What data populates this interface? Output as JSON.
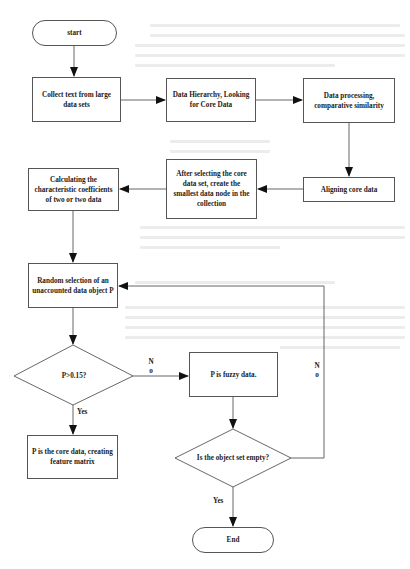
{
  "diagram": {
    "type": "flowchart",
    "nodes": {
      "start": {
        "label": "start",
        "shape": "terminator"
      },
      "collect": {
        "label": "Collect text from large data sets",
        "shape": "process"
      },
      "hierarchy": {
        "label": "Data Hierarchy, Looking for Core Data",
        "shape": "process"
      },
      "processing": {
        "label": "Data processing, comparative similarity",
        "shape": "process"
      },
      "aligning": {
        "label": "Aligning core data",
        "shape": "process"
      },
      "after_selecting": {
        "label": "After selecting the core data set, create the smallest data node in the collection",
        "shape": "process"
      },
      "calculating": {
        "label": "Calculating the characteristic coefficients of two or two data",
        "shape": "process"
      },
      "random": {
        "label": "Random selection of an unaccounted data object P",
        "shape": "process"
      },
      "decision_p": {
        "label": "P>0.15?",
        "shape": "decision"
      },
      "fuzzy": {
        "label": "P is fuzzy data.",
        "shape": "process"
      },
      "core": {
        "label": "P is the core data, creating feature matrix",
        "shape": "process"
      },
      "decision_empty": {
        "label": "Is the object set empty?",
        "shape": "decision"
      },
      "end": {
        "label": "End",
        "shape": "terminator"
      }
    },
    "edge_labels": {
      "p_no": "N\no",
      "p_yes": "Yes",
      "empty_no": "N\no",
      "empty_yes": "Yes"
    },
    "edges": [
      {
        "from": "start",
        "to": "collect"
      },
      {
        "from": "collect",
        "to": "hierarchy"
      },
      {
        "from": "hierarchy",
        "to": "processing"
      },
      {
        "from": "processing",
        "to": "aligning"
      },
      {
        "from": "aligning",
        "to": "after_selecting"
      },
      {
        "from": "after_selecting",
        "to": "calculating"
      },
      {
        "from": "calculating",
        "to": "random"
      },
      {
        "from": "random",
        "to": "decision_p"
      },
      {
        "from": "decision_p",
        "to": "fuzzy",
        "label": "No"
      },
      {
        "from": "decision_p",
        "to": "core",
        "label": "Yes"
      },
      {
        "from": "fuzzy",
        "to": "decision_empty"
      },
      {
        "from": "decision_empty",
        "to": "random",
        "label": "No"
      },
      {
        "from": "decision_empty",
        "to": "end",
        "label": "Yes"
      }
    ]
  },
  "colors": {
    "stroke": "#555555",
    "text": "#222222",
    "background": "#ffffff"
  }
}
